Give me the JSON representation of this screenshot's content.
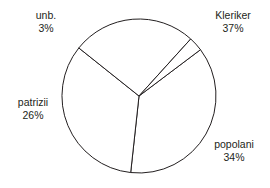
{
  "chart_data": {
    "type": "pie",
    "title": "",
    "labels": [
      "Kleriker",
      "popolani",
      "patrizii",
      "unb."
    ],
    "values": [
      37,
      34,
      26,
      3
    ],
    "value_labels": [
      "37%",
      "34%",
      "26%",
      "3%"
    ],
    "units": "percent",
    "legend": "none",
    "slice_colors": [
      "#ffffff",
      "#ffffff",
      "#ffffff",
      "#ffffff"
    ],
    "stroke_color": "#231f20",
    "background_color": "#ffffff",
    "label_placement": "outside",
    "slices": [
      {
        "name": "Kleriker",
        "value": 37,
        "value_label": "37%",
        "label_position": "top-right"
      },
      {
        "name": "popolani",
        "value": 34,
        "value_label": "34%",
        "label_position": "bottom-right"
      },
      {
        "name": "patrizii",
        "value": 26,
        "value_label": "26%",
        "label_position": "left"
      },
      {
        "name": "unb.",
        "value": 3,
        "value_label": "3%",
        "label_position": "top-left"
      }
    ]
  }
}
